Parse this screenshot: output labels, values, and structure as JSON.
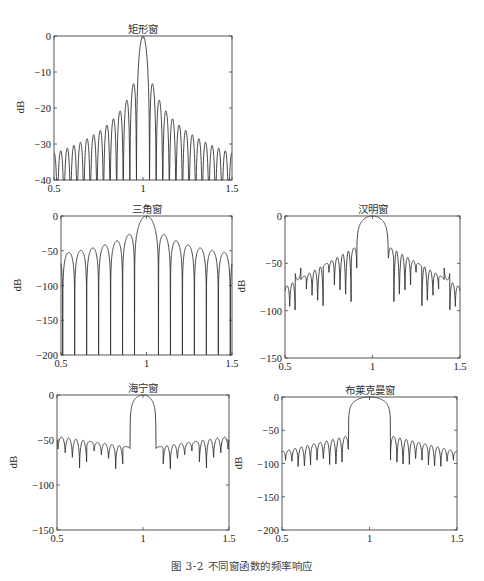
{
  "figure": {
    "caption": "图 3-2   不同窗函数的频率响应"
  },
  "chart_data": [
    {
      "id": "rect",
      "type": "line",
      "title": "矩形窗",
      "xlabel": "",
      "ylabel": "dB",
      "xlim": [
        0.5,
        1.5
      ],
      "ylim": [
        -40,
        0
      ],
      "xticks": [
        0.5,
        1,
        1.5
      ],
      "xtick_labels": [
        "0.5",
        "1",
        "1.5"
      ],
      "yticks": [
        0,
        -10,
        -20,
        -30,
        -40
      ],
      "ytick_labels": [
        "0",
        "−10",
        "−20",
        "−30",
        "−40"
      ],
      "grid": false,
      "box": {
        "x": 54,
        "y": 36,
        "w": 178,
        "h": 144
      },
      "model": {
        "kind": "rect",
        "null_spacing": 0.037
      },
      "notes": "Main lobe peak 0 dB at 1; first sidelobes ≈ −13 dB; sidelobes decay to ≈ −31 dB at edges"
    },
    {
      "id": "triangle",
      "type": "line",
      "title": "三角窗",
      "xlabel": "",
      "ylabel": "dB",
      "xlim": [
        0.5,
        1.5
      ],
      "ylim": [
        -200,
        0
      ],
      "xticks": [
        0.5,
        1,
        1.5
      ],
      "xtick_labels": [
        "0.5",
        "1",
        "1.5"
      ],
      "yticks": [
        0,
        -50,
        -100,
        -150,
        -200
      ],
      "ytick_labels": [
        "0",
        "−50",
        "−100",
        "−150",
        "−200"
      ],
      "grid": false,
      "box": {
        "x": 61,
        "y": 216,
        "w": 171,
        "h": 139
      },
      "model": {
        "kind": "triangle",
        "null_spacing": 0.07
      },
      "notes": "Main lobe 0 dB at 1; first sidelobes ≈ −27 dB; decay to ≈ −50 dB at edges; nulls reach −200"
    },
    {
      "id": "hamming",
      "type": "line",
      "title": "汉明窗",
      "xlabel": "",
      "ylabel": "dB",
      "xlim": [
        0.5,
        1.5
      ],
      "ylim": [
        -150,
        0
      ],
      "xticks": [
        0.5,
        1,
        1.5
      ],
      "xtick_labels": [
        "0.5",
        "1",
        "1.5"
      ],
      "yticks": [
        0,
        -50,
        -100,
        -150
      ],
      "ytick_labels": [
        "0",
        "−50",
        "−100",
        "−150"
      ],
      "grid": false,
      "box": {
        "x": 285,
        "y": 216,
        "w": 175,
        "h": 142
      },
      "model": {
        "kind": "hamming",
        "main_half_width": 0.09,
        "null_spacing": 0.032,
        "first_sidelobe_db": -32,
        "edge_sidelobe_db": -75,
        "null_depth_db": [
          -55,
          -110
        ]
      },
      "notes": "Main lobe 0 dB; first sidelobes ≈ −32 dB; decay to ≈ −75 dB at edges"
    },
    {
      "id": "hanning",
      "type": "line",
      "title": "海宁窗",
      "xlabel": "",
      "ylabel": "dB",
      "xlim": [
        0.5,
        1.5
      ],
      "ylim": [
        -150,
        0
      ],
      "xticks": [
        0.5,
        1,
        1.5
      ],
      "xtick_labels": [
        "0.5",
        "1",
        "1.5"
      ],
      "yticks": [
        0,
        -50,
        -100,
        -150
      ],
      "ytick_labels": [
        "0",
        "−50",
        "−100",
        "−150"
      ],
      "grid": false,
      "box": {
        "x": 57,
        "y": 395,
        "w": 172,
        "h": 135
      },
      "model": {
        "kind": "hanning",
        "main_half_width": 0.075,
        "null_spacing": 0.042,
        "first_sidelobe_db": -58,
        "edge_sidelobe_db": -46,
        "null_depth_db": [
          -60,
          -88
        ]
      },
      "notes": "Main lobe 0 dB between ≈0.925 and ≈1.075; sidelobes roughly flat at ≈ −45 to −50 dB"
    },
    {
      "id": "blackman",
      "type": "line",
      "title": "布莱克曼窗",
      "xlabel": "",
      "ylabel": "dB",
      "xlim": [
        0.5,
        1.5
      ],
      "ylim": [
        -200,
        0
      ],
      "xticks": [
        0.5,
        1,
        1.5
      ],
      "xtick_labels": [
        "0.5",
        "1",
        "1.5"
      ],
      "yticks": [
        0,
        -50,
        -100,
        -150,
        -200
      ],
      "ytick_labels": [
        "0",
        "−50",
        "−100",
        "−150",
        "−200"
      ],
      "grid": false,
      "box": {
        "x": 282,
        "y": 397,
        "w": 175,
        "h": 133
      },
      "model": {
        "kind": "blackman",
        "main_half_width": 0.12,
        "null_spacing": 0.036,
        "first_sidelobe_db": -58,
        "edge_sidelobe_db": -82,
        "null_depth_db": [
          -95,
          -120
        ]
      },
      "notes": "Main lobe 0 dB between ≈0.88 and ≈1.12; first sidelobes ≈ −58 dB; decay to ≈ −82 dB at edges"
    }
  ]
}
